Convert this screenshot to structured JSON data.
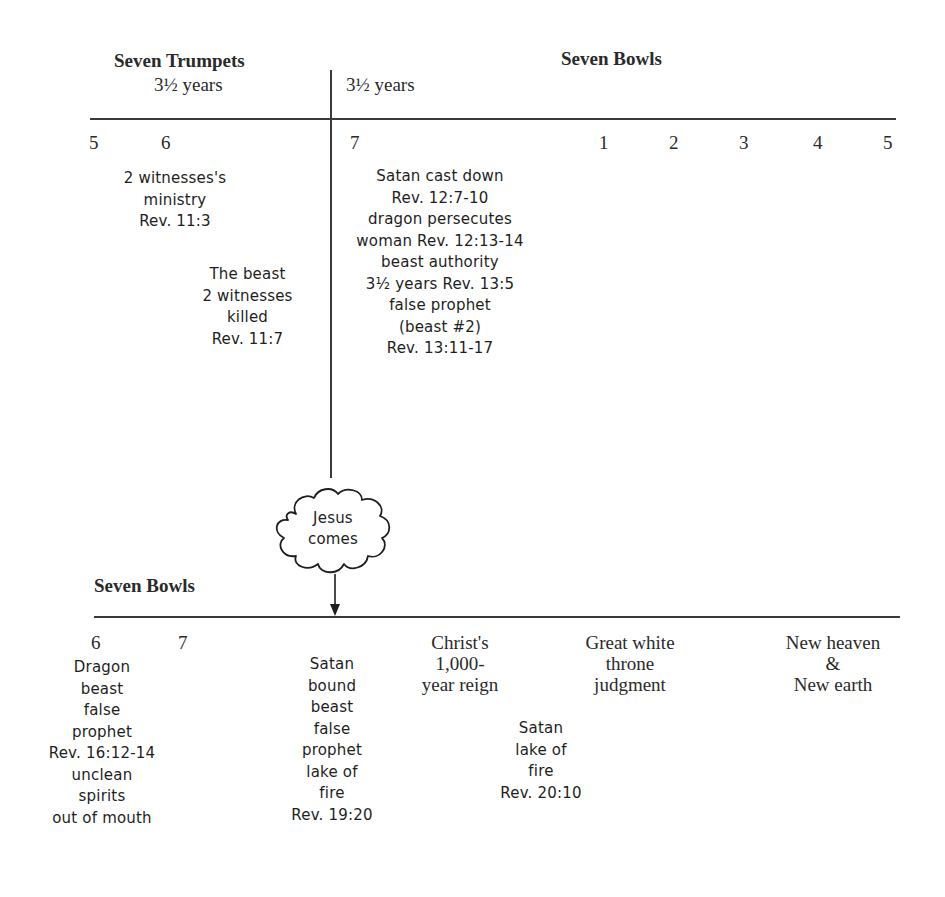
{
  "top_section": {
    "left_heading": "Seven Trumpets",
    "left_duration": "3½ years",
    "right_duration": "3½ years",
    "right_heading": "Seven Bowls",
    "trumpet_numbers": [
      "5",
      "6",
      "7"
    ],
    "bowl_numbers": [
      "1",
      "2",
      "3",
      "4",
      "5"
    ],
    "notes": [
      {
        "id": "witnesses-ministry",
        "text": "2 witnesses's\nministry\nRev. 11:3"
      },
      {
        "id": "witnesses-killed",
        "text": "The beast\n2 witnesses\nkilled\nRev. 11:7"
      },
      {
        "id": "trumpet-7-events",
        "text": "Satan cast down\nRev. 12:7-10\ndragon persecutes\nwoman Rev. 12:13-14\nbeast authority\n3½ years Rev. 13:5\nfalse prophet\n(beast #2)\nRev. 13:11-17"
      }
    ]
  },
  "event": {
    "cloud_label": "Jesus\ncomes"
  },
  "bottom_section": {
    "heading": "Seven Bowls",
    "bowl_numbers": [
      "6",
      "7"
    ],
    "notes": [
      {
        "id": "bowl-6-events",
        "text": "Dragon\nbeast\nfalse\nprophet\nRev. 16:12-14\nunclean\nspirits\nout of mouth"
      },
      {
        "id": "satan-bound",
        "text": "Satan\nbound\nbeast\nfalse\nprophet\nlake of\nfire\nRev. 19:20"
      },
      {
        "id": "satan-lake-of-fire",
        "text": "Satan\nlake of\nfire\nRev. 20:10"
      }
    ],
    "phases": [
      {
        "id": "millennium",
        "text": "Christ's\n1,000-\nyear reign"
      },
      {
        "id": "great-white-throne",
        "text": "Great white\nthrone\njudgment"
      },
      {
        "id": "new-heaven-earth",
        "text": "New heaven\n&\nNew earth"
      }
    ]
  },
  "colors": {
    "line": "#3a3a3a",
    "text": "#222222",
    "background": "#ffffff"
  }
}
